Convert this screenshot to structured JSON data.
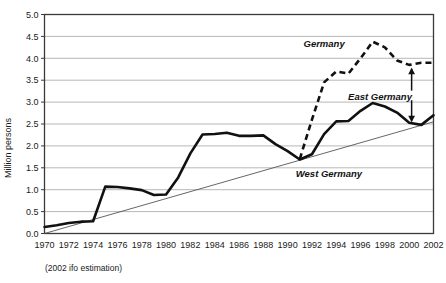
{
  "chart_data": {
    "type": "line",
    "title": "",
    "xlabel": "",
    "ylabel": "Million persons",
    "ylim": [
      0.0,
      5.0
    ],
    "xlim": [
      1970,
      2002
    ],
    "grid": true,
    "legend_position": "inline-annotations",
    "ytick_labels": [
      "0.0",
      "0.5",
      "1.0",
      "1.5",
      "2.0",
      "2.5",
      "3.0",
      "3.5",
      "4.0",
      "4.5",
      "5.0"
    ],
    "ytick_values": [
      0.0,
      0.5,
      1.0,
      1.5,
      2.0,
      2.5,
      3.0,
      3.5,
      4.0,
      4.5,
      5.0
    ],
    "xtick_labels": [
      "1970",
      "1972",
      "1974",
      "1976",
      "1978",
      "1980",
      "1982",
      "1984",
      "1986",
      "1988",
      "1990",
      "1992",
      "1994",
      "1996",
      "1998",
      "2000",
      "2002"
    ],
    "xtick_values": [
      1970,
      1972,
      1974,
      1976,
      1978,
      1980,
      1982,
      1984,
      1986,
      1988,
      1990,
      1992,
      1994,
      1996,
      1998,
      2000,
      2002
    ],
    "footnote": "(2002 ifo estimation)",
    "annotations": [
      {
        "name": "germany-label",
        "text": "Germany",
        "x": 1993.0,
        "y": 4.25
      },
      {
        "name": "east-germany-label",
        "text": "East Germany",
        "x": 1997.6,
        "y": 3.05
      },
      {
        "name": "west-germany-label",
        "text": "West Germany",
        "x": 1993.4,
        "y": 1.3
      },
      {
        "name": "east-germany-gap-arrow",
        "text": "",
        "x": 2000.2,
        "y_top": 3.9,
        "y_bottom": 2.45
      }
    ],
    "series": [
      {
        "name": "Germany",
        "style": "dashed",
        "x": [
          1991,
          1992,
          1993,
          1994,
          1995,
          1996,
          1997,
          1998,
          1999,
          2000,
          2001,
          2002
        ],
        "values": [
          1.7,
          2.6,
          3.45,
          3.7,
          3.65,
          4.0,
          4.38,
          4.25,
          3.95,
          3.85,
          3.9,
          3.9
        ]
      },
      {
        "name": "West Germany",
        "style": "solid-thick",
        "x": [
          1970,
          1971,
          1972,
          1973,
          1974,
          1975,
          1976,
          1977,
          1978,
          1979,
          1980,
          1981,
          1982,
          1983,
          1984,
          1985,
          1986,
          1987,
          1988,
          1989,
          1990,
          1991,
          1992,
          1993,
          1994,
          1995,
          1996,
          1997,
          1998,
          1999,
          2000,
          2001,
          2002
        ],
        "values": [
          0.15,
          0.19,
          0.24,
          0.27,
          0.28,
          1.07,
          1.06,
          1.03,
          0.99,
          0.88,
          0.89,
          1.28,
          1.83,
          2.26,
          2.27,
          2.3,
          2.23,
          2.23,
          2.24,
          2.04,
          1.88,
          1.69,
          1.81,
          2.27,
          2.56,
          2.57,
          2.8,
          2.98,
          2.9,
          2.76,
          2.53,
          2.48,
          2.7
        ]
      },
      {
        "name": "Trend",
        "style": "solid-thin",
        "x": [
          1970,
          2002
        ],
        "values": [
          0.0,
          2.55
        ]
      }
    ]
  }
}
